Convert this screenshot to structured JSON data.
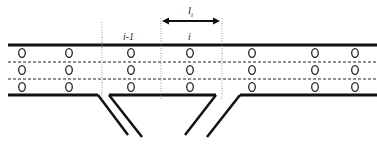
{
  "diagram": {
    "type": "freeway-segment-schematic",
    "lanes": 3,
    "segment_labels": {
      "length_label": "l",
      "length_subscript": "i",
      "prev_segment": "i-1",
      "current_segment": "i"
    },
    "vehicle_glyph": "O",
    "vehicle_columns_x": [
      22,
      69,
      131,
      190,
      252,
      315,
      355
    ],
    "lane_rows_y": [
      53,
      70,
      87
    ],
    "features": [
      "off-ramp",
      "on-ramp"
    ],
    "colors": {
      "line": "#111111",
      "dotted": "#999999",
      "background": "#ffffff"
    }
  }
}
